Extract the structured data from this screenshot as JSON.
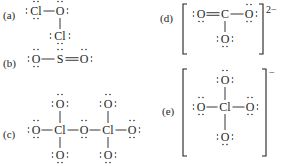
{
  "figure": {
    "structures": [
      {
        "id": "a",
        "label": "(a)",
        "atoms": [
          {
            "symbol": "Cl",
            "lone_pairs": [
              "left",
              "top",
              "bottom"
            ]
          },
          {
            "symbol": "O",
            "lone_pairs": [
              "top",
              "right"
            ]
          },
          {
            "symbol": "Cl",
            "lone_pairs": [
              "left",
              "right",
              "bottom"
            ]
          }
        ],
        "bonds": [
          {
            "from": 0,
            "to": 1,
            "order": 1
          },
          {
            "from": 1,
            "to": 2,
            "order": 1
          }
        ]
      },
      {
        "id": "b",
        "label": "(b)",
        "atoms": [
          {
            "symbol": "O",
            "lone_pairs": [
              "left",
              "top",
              "bottom"
            ]
          },
          {
            "symbol": "S",
            "lone_pairs": [
              "top"
            ]
          },
          {
            "symbol": "O",
            "lone_pairs": [
              "top",
              "right"
            ]
          }
        ],
        "bonds": [
          {
            "from": 0,
            "to": 1,
            "order": 1
          },
          {
            "from": 1,
            "to": 2,
            "order": 2
          }
        ]
      },
      {
        "id": "c",
        "label": "(c)",
        "atoms": [
          {
            "symbol": "O",
            "lone_pairs": [
              "left",
              "top",
              "bottom"
            ]
          },
          {
            "symbol": "Cl",
            "lone_pairs": []
          },
          {
            "symbol": "O",
            "lone_pairs": [
              "top",
              "bottom"
            ]
          },
          {
            "symbol": "Cl",
            "lone_pairs": []
          },
          {
            "symbol": "O",
            "lone_pairs": [
              "right",
              "top",
              "bottom"
            ]
          },
          {
            "symbol": "O",
            "lone_pairs": [
              "left",
              "top",
              "right"
            ]
          },
          {
            "symbol": "O",
            "lone_pairs": [
              "left",
              "bottom",
              "right"
            ]
          },
          {
            "symbol": "O",
            "lone_pairs": [
              "left",
              "top",
              "right"
            ]
          },
          {
            "symbol": "O",
            "lone_pairs": [
              "left",
              "bottom",
              "right"
            ]
          }
        ],
        "bonds": [
          {
            "from": 0,
            "to": 1,
            "order": 1
          },
          {
            "from": 1,
            "to": 2,
            "order": 1
          },
          {
            "from": 2,
            "to": 3,
            "order": 1
          },
          {
            "from": 3,
            "to": 4,
            "order": 1
          },
          {
            "from": 1,
            "to": 5,
            "order": 1
          },
          {
            "from": 1,
            "to": 6,
            "order": 1
          },
          {
            "from": 3,
            "to": 7,
            "order": 1
          },
          {
            "from": 3,
            "to": 8,
            "order": 1
          }
        ]
      },
      {
        "id": "d",
        "label": "(d)",
        "charge": "2−",
        "atoms": [
          {
            "symbol": "O",
            "lone_pairs": [
              "left",
              "bottom"
            ]
          },
          {
            "symbol": "C",
            "lone_pairs": []
          },
          {
            "symbol": "O",
            "lone_pairs": [
              "top",
              "right",
              "bottom"
            ]
          },
          {
            "symbol": "O",
            "lone_pairs": [
              "left",
              "right",
              "bottom"
            ]
          }
        ],
        "bonds": [
          {
            "from": 0,
            "to": 1,
            "order": 2
          },
          {
            "from": 1,
            "to": 2,
            "order": 1
          },
          {
            "from": 1,
            "to": 3,
            "order": 1
          }
        ]
      },
      {
        "id": "e",
        "label": "(e)",
        "charge": "−",
        "atoms": [
          {
            "symbol": "O",
            "lone_pairs": [
              "left",
              "top",
              "right"
            ]
          },
          {
            "symbol": "O",
            "lone_pairs": [
              "left",
              "top",
              "bottom"
            ]
          },
          {
            "symbol": "Cl",
            "lone_pairs": []
          },
          {
            "symbol": "O",
            "lone_pairs": [
              "top",
              "right",
              "bottom"
            ]
          },
          {
            "symbol": "O",
            "lone_pairs": [
              "left",
              "right",
              "bottom"
            ]
          }
        ],
        "bonds": [
          {
            "from": 0,
            "to": 2,
            "order": 1
          },
          {
            "from": 1,
            "to": 2,
            "order": 1
          },
          {
            "from": 2,
            "to": 3,
            "order": 1
          },
          {
            "from": 2,
            "to": 4,
            "order": 1
          }
        ]
      }
    ]
  }
}
